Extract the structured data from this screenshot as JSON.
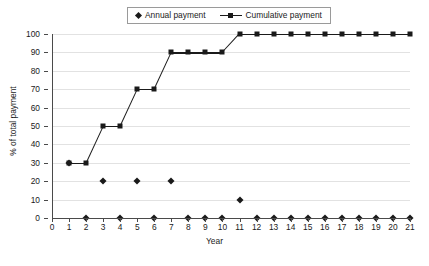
{
  "legend": {
    "position": "top-center",
    "entries": [
      {
        "label": "Annual payment",
        "marker": "diamond-marker-icon",
        "line": false
      },
      {
        "label": "Cumulative payment",
        "marker": "square-marker-icon",
        "line": true
      }
    ]
  },
  "axes": {
    "y_title": "% of total payment",
    "x_title": "Year",
    "y_ticks": [
      "0",
      "10",
      "20",
      "30",
      "40",
      "50",
      "60",
      "70",
      "80",
      "90",
      "100"
    ],
    "x_ticks": [
      "0",
      "1",
      "2",
      "3",
      "4",
      "5",
      "6",
      "7",
      "8",
      "9",
      "10",
      "11",
      "12",
      "13",
      "14",
      "15",
      "16",
      "17",
      "18",
      "19",
      "20",
      "21"
    ]
  },
  "colors": {
    "series": "#1a1a1a",
    "grid": "#e2e2e2",
    "axis": "#4a4a4a",
    "background": "#ffffff",
    "legend_border": "#9a9a9a"
  },
  "chart_data": {
    "type": "line",
    "title": "",
    "xlabel": "Year",
    "ylabel": "% of total payment",
    "xlim": [
      0,
      21
    ],
    "ylim": [
      0,
      100
    ],
    "yticks": [
      0,
      10,
      20,
      30,
      40,
      50,
      60,
      70,
      80,
      90,
      100
    ],
    "xticks": [
      0,
      1,
      2,
      3,
      4,
      5,
      6,
      7,
      8,
      9,
      10,
      11,
      12,
      13,
      14,
      15,
      16,
      17,
      18,
      19,
      20,
      21
    ],
    "grid": "horizontal",
    "legend_position": "top-center",
    "x": [
      1,
      2,
      3,
      4,
      5,
      6,
      7,
      8,
      9,
      10,
      11,
      12,
      13,
      14,
      15,
      16,
      17,
      18,
      19,
      20,
      21
    ],
    "series": [
      {
        "name": "Annual payment",
        "marker": "diamond",
        "line": false,
        "values": [
          30,
          0,
          20,
          0,
          20,
          0,
          20,
          0,
          0,
          0,
          10,
          0,
          0,
          0,
          0,
          0,
          0,
          0,
          0,
          0,
          0
        ]
      },
      {
        "name": "Cumulative payment",
        "marker": "square",
        "line": true,
        "values": [
          30,
          30,
          50,
          50,
          70,
          70,
          90,
          90,
          90,
          90,
          100,
          100,
          100,
          100,
          100,
          100,
          100,
          100,
          100,
          100,
          100
        ]
      }
    ]
  }
}
